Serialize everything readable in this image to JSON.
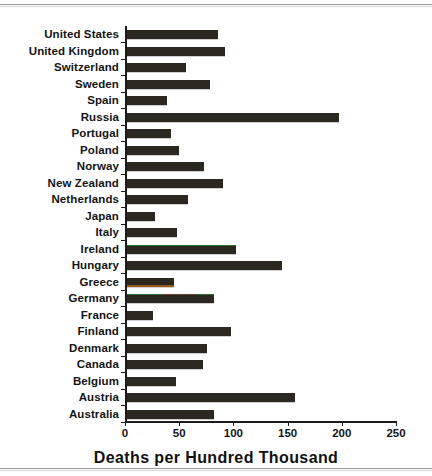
{
  "chart_data": {
    "type": "bar",
    "orientation": "horizontal",
    "title": "",
    "xlabel": "Deaths per Hundred Thousand",
    "ylabel": "",
    "xlim": [
      0,
      250
    ],
    "xticks": [
      0,
      50,
      100,
      150,
      200,
      250
    ],
    "grid": false,
    "legend": null,
    "bar_color": "#2b2721",
    "categories": [
      "United States",
      "United Kingdom",
      "Switzerland",
      "Sweden",
      "Spain",
      "Russia",
      "Portugal",
      "Poland",
      "Norway",
      "New Zealand",
      "Netherlands",
      "Japan",
      "Italy",
      "Ireland",
      "Hungary",
      "Greece",
      "Germany",
      "France",
      "Finland",
      "Denmark",
      "Canada",
      "Belgium",
      "Austria",
      "Australia"
    ],
    "values": [
      84,
      90,
      54,
      77,
      37,
      196,
      41,
      48,
      71,
      89,
      56,
      26,
      46,
      101,
      143,
      43,
      80,
      24,
      96,
      74,
      70,
      45,
      155,
      80
    ]
  },
  "axis": {
    "x_tick_labels": [
      "0",
      "50",
      "100",
      "150",
      "200",
      "250"
    ],
    "x_axis_title": "Deaths per Hundred Thousand"
  }
}
